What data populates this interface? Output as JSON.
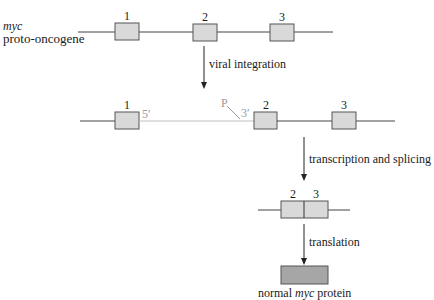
{
  "gene_label": {
    "italic": "myc",
    "text": "proto-oncogene"
  },
  "row1": {
    "exons": [
      "1",
      "2",
      "3"
    ]
  },
  "step1": {
    "label": "viral integration"
  },
  "row2": {
    "exons": [
      "1",
      "2",
      "3"
    ],
    "five_prime": "5′",
    "three_prime": "3′",
    "promoter": "P"
  },
  "step2": {
    "label": "transcription and splicing"
  },
  "mrna": {
    "exons": [
      "2",
      "3"
    ]
  },
  "step3": {
    "label": "translation"
  },
  "protein": {
    "prefix": "normal",
    "italic": "myc",
    "suffix": "protein"
  },
  "colors": {
    "exon_fill": "#d9d9d9",
    "exon_stroke": "#555555",
    "protein_fill": "#a6a6a6",
    "viral_line": "#c0c0c0",
    "dna_line": "#444444"
  }
}
